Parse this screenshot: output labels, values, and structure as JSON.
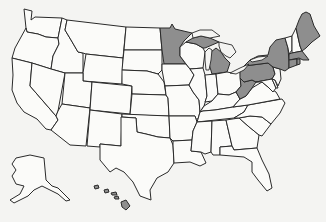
{
  "map": {
    "title": "",
    "region": "United States",
    "colors": {
      "background": "#f4f4f2",
      "unshaded": "#fbfbf9",
      "shaded": "#8e8e8e",
      "border": "#2a2a2a"
    },
    "shaded_states": [
      "Minnesota",
      "Michigan",
      "Maine",
      "New York",
      "Pennsylvania",
      "Massachusetts",
      "Connecticut",
      "Rhode Island",
      "West Virginia",
      "Hawaii"
    ],
    "unshaded_states": [
      "Washington",
      "Oregon",
      "California",
      "Idaho",
      "Nevada",
      "Montana",
      "Wyoming",
      "Utah",
      "Arizona",
      "Colorado",
      "New Mexico",
      "North Dakota",
      "South Dakota",
      "Nebraska",
      "Kansas",
      "Oklahoma",
      "Texas",
      "Iowa",
      "Missouri",
      "Arkansas",
      "Louisiana",
      "Wisconsin",
      "Illinois",
      "Indiana",
      "Ohio",
      "Kentucky",
      "Tennessee",
      "Mississippi",
      "Alabama",
      "Georgia",
      "Florida",
      "South Carolina",
      "North Carolina",
      "Virginia",
      "Maryland",
      "Delaware",
      "New Jersey",
      "Vermont",
      "New Hampshire",
      "Alaska"
    ]
  }
}
